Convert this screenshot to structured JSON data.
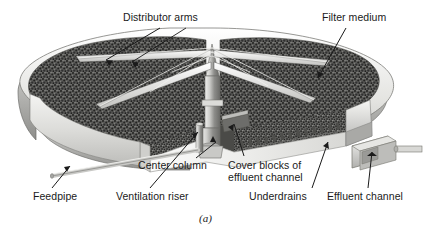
{
  "figure": {
    "caption": "(a)",
    "background_color": "#ffffff",
    "ink_color": "#1a1a1a"
  },
  "labels": {
    "distributor_arms": "Distributor arms",
    "filter_medium": "Filter medium",
    "center_column": "Center column",
    "cover_blocks_line1": "Cover blocks of",
    "cover_blocks_line2": "effluent channel",
    "feedpipe": "Feedpipe",
    "ventilation_riser": "Ventilation riser",
    "underdrains": "Underdrains",
    "effluent_channel": "Effluent channel"
  },
  "colors": {
    "media_dark": "#4a4a4a",
    "media_speckle": "#2b2b2b",
    "wall_light": "#e8e8e6",
    "wall_mid": "#b9b9b6",
    "wall_shadow": "#8f8f8c",
    "concrete": "#d5d5d2",
    "leader_line": "#1a1a1a",
    "outline": "#5d5d5a"
  }
}
